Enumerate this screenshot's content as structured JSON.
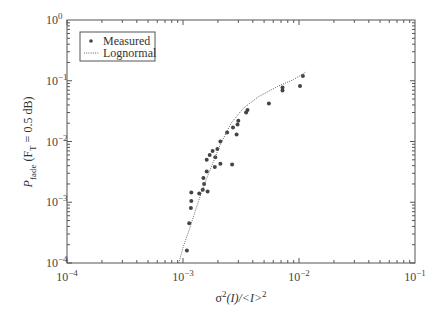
{
  "chart_data": {
    "type": "scatter",
    "title": "",
    "xlabel": "σ²(I)/<I>²",
    "ylabel": "P_fade (F_T = 0.5 dB)",
    "xscale": "log",
    "yscale": "log",
    "xlim": [
      0.0001,
      0.1
    ],
    "ylim": [
      0.0001,
      1
    ],
    "x_ticks": [
      "10^-4",
      "10^-3",
      "10^-2",
      "10^-1"
    ],
    "y_ticks": [
      "10^-4",
      "10^-3",
      "10^-2",
      "10^-1",
      "10^0"
    ],
    "grid": false,
    "legend_position": "upper left",
    "series": [
      {
        "name": "Measured",
        "style": "markers",
        "color": "#444444",
        "points": [
          [
            0.00108,
            0.00016
          ],
          [
            0.00113,
            0.00045
          ],
          [
            0.00117,
            0.0008
          ],
          [
            0.00118,
            0.00105
          ],
          [
            0.00118,
            0.00145
          ],
          [
            0.00138,
            0.0014
          ],
          [
            0.00148,
            0.0016
          ],
          [
            0.00152,
            0.002
          ],
          [
            0.00163,
            0.0015
          ],
          [
            0.0015,
            0.0025
          ],
          [
            0.0016,
            0.0032
          ],
          [
            0.00188,
            0.0038
          ],
          [
            0.0016,
            0.005
          ],
          [
            0.0017,
            0.006
          ],
          [
            0.0018,
            0.007
          ],
          [
            0.00198,
            0.0075
          ],
          [
            0.0021,
            0.01
          ],
          [
            0.0019,
            0.0055
          ],
          [
            0.0021,
            0.0043
          ],
          [
            0.00265,
            0.0042
          ],
          [
            0.0024,
            0.014
          ],
          [
            0.0027,
            0.017
          ],
          [
            0.00295,
            0.019
          ],
          [
            0.0029,
            0.013
          ],
          [
            0.003,
            0.022
          ],
          [
            0.0035,
            0.03
          ],
          [
            0.0036,
            0.033
          ],
          [
            0.0055,
            0.042
          ],
          [
            0.0072,
            0.069
          ],
          [
            0.0072,
            0.077
          ],
          [
            0.0102,
            0.082
          ],
          [
            0.0108,
            0.12
          ]
        ]
      },
      {
        "name": "Lognormal",
        "style": "dotted-line",
        "color": "#666666",
        "points": [
          [
            0.00092,
            0.0001
          ],
          [
            0.001,
            0.00018
          ],
          [
            0.00113,
            0.00035
          ],
          [
            0.0013,
            0.0008
          ],
          [
            0.0015,
            0.0018
          ],
          [
            0.00175,
            0.0038
          ],
          [
            0.0021,
            0.009
          ],
          [
            0.0026,
            0.02
          ],
          [
            0.0033,
            0.035
          ],
          [
            0.0045,
            0.055
          ],
          [
            0.0065,
            0.08
          ],
          [
            0.009,
            0.105
          ],
          [
            0.0115,
            0.14
          ]
        ]
      }
    ]
  },
  "legend": {
    "items": [
      {
        "label": "Measured"
      },
      {
        "label": "Lognormal"
      }
    ]
  },
  "axes": {
    "x_tick_labels": [
      {
        "base": "10",
        "exp": "−4"
      },
      {
        "base": "10",
        "exp": "−3"
      },
      {
        "base": "10",
        "exp": "−2"
      },
      {
        "base": "10",
        "exp": "−1"
      }
    ],
    "y_tick_labels": [
      {
        "base": "10",
        "exp": "0"
      },
      {
        "base": "10",
        "exp": "−1"
      },
      {
        "base": "10",
        "exp": "−2"
      },
      {
        "base": "10",
        "exp": "−3"
      },
      {
        "base": "10",
        "exp": "−4"
      }
    ],
    "xlabel": {
      "sigma": "σ",
      "sup": "2",
      "paren": "(I)/<I>",
      "sup2": "2"
    },
    "ylabel": {
      "P": "P",
      "sub": "fade",
      "rest": " (F",
      "sub2": "T",
      "rest2": " = 0.5 dB)"
    }
  }
}
